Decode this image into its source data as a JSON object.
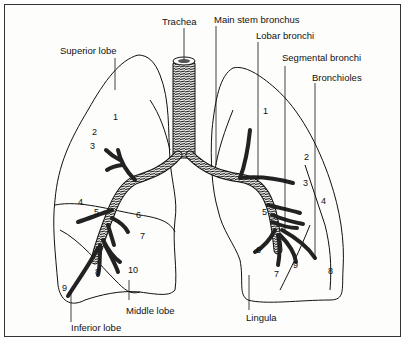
{
  "diagram": {
    "labels": {
      "trachea": "Trachea",
      "main_stem_bronchus": "Main stem bronchus",
      "lobar_bronchi": "Lobar bronchi",
      "segmental_bronchi": "Segmental bronchi",
      "bronchioles": "Bronchioles",
      "superior_lobe": "Superior lobe",
      "middle_lobe": "Middle lobe",
      "inferior_lobe": "Inferior lobe",
      "lingula": "Lingula"
    },
    "right_lung_segments": [
      "1",
      "2",
      "3",
      "4",
      "5",
      "6",
      "7",
      "8",
      "9",
      "10"
    ],
    "left_lung_segments": [
      "1",
      "2",
      "3",
      "4",
      "5",
      "6",
      "7",
      "8",
      "9"
    ]
  }
}
